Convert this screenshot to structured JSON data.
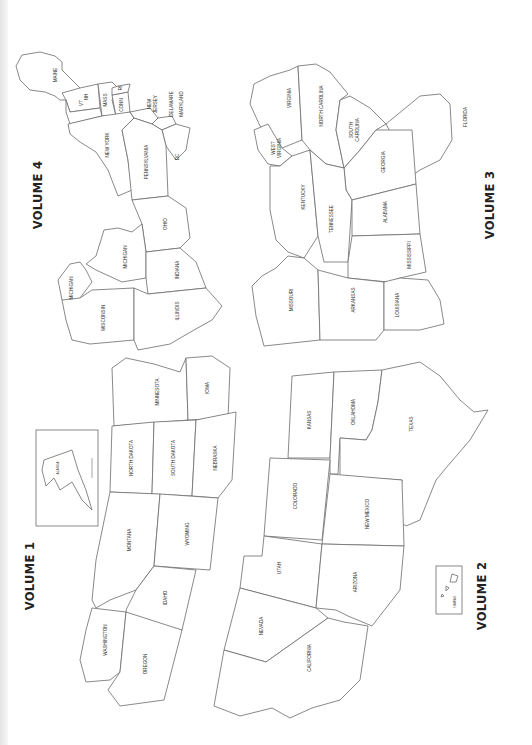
{
  "page": {
    "orientation": "rotated-90-counterclockwise",
    "background": "#ffffff",
    "line_color": "#6b6b6b",
    "text_color": "#222222"
  },
  "volumes": [
    {
      "title": "VOLUME 4",
      "states": [
        "MAINE",
        "VT",
        "NH",
        "MASS",
        "CONN",
        "RI",
        "NEW YORK",
        "NEW JERSEY",
        "DELAWARE",
        "MARYLAND",
        "PENNSYLVANIA",
        "DC",
        "OHIO",
        "MICHIGAN",
        "MICHIGAN",
        "INDIANA",
        "WISCONSIN",
        "ILLINOIS"
      ]
    },
    {
      "title": "VOLUME 3",
      "states": [
        "VIRGINIA",
        "WEST VIRGINIA",
        "NORTH CAROLINA",
        "SOUTH CAROLINA",
        "FLORIDA",
        "GEORGIA",
        "KENTUCKY",
        "TENNESSEE",
        "ALABAMA",
        "MISSISSIPPI",
        "MISSOURI",
        "ARKANSAS",
        "LOUISIANA"
      ]
    },
    {
      "title": "VOLUME 1",
      "states": [
        "MINNESOTA",
        "IOWA",
        "NORTH DAKOTA",
        "SOUTH DAKOTA",
        "NEBRASKA",
        "MONTANA",
        "WYOMING",
        "IDAHO",
        "WASHINGTON",
        "OREGON"
      ],
      "inset": "ALASKA"
    },
    {
      "title": "VOLUME 2",
      "states": [
        "KANSAS",
        "OKLAHOMA",
        "TEXAS",
        "COLORADO",
        "NEW MEXICO",
        "UTAH",
        "ARIZONA",
        "NEVADA",
        "CALIFORNIA"
      ],
      "inset": "HAWAII"
    }
  ],
  "labels": {
    "maine": "MAINE",
    "vt": "VT",
    "nh": "NH",
    "mass": "MASS",
    "conn": "CONN",
    "ri": "RI",
    "new_york": "NEW YORK",
    "new": "NEW",
    "jersey": "JERSEY",
    "delaware": "DELAWARE",
    "maryland": "MARYLAND",
    "pennsylvania": "PENNSYLVANIA",
    "dc": "DC",
    "ohio": "OHIO",
    "michigan_lower": "MICHIGAN",
    "michigan_upper": "MICHIGAN",
    "indiana": "INDIANA",
    "wisconsin": "WISCONSIN",
    "illinois": "ILLINOIS",
    "virginia": "VIRGINIA",
    "west": "WEST",
    "virginia2": "VIRGINIA",
    "north_carolina": "NORTH CAROLINA",
    "south": "SOUTH",
    "carolina": "CAROLINA",
    "florida": "FLORIDA",
    "georgia": "GEORGIA",
    "kentucky": "KENTUCKY",
    "tennessee": "TENNESSEE",
    "alabama": "ALABAMA",
    "mississippi": "MISSISSIPPI",
    "missouri": "MISSOURI",
    "arkansas": "ARKANSAS",
    "louisiana": "LOUISIANA",
    "minnesota": "MINNESOTA",
    "iowa": "IOWA",
    "north_dakota": "NORTH DAKOTA",
    "south_dakota": "SOUTH DAKOTA",
    "nebraska": "NEBRASKA",
    "montana": "MONTANA",
    "wyoming": "WYOMING",
    "idaho": "IDAHO",
    "washington": "WASHINGTON",
    "oregon": "OREGON",
    "alaska": "ALASKA",
    "kansas": "KANSAS",
    "oklahoma": "OKLAHOMA",
    "texas": "TEXAS",
    "colorado": "COLORADO",
    "new_mexico": "NEW MEXICO",
    "utah": "UTAH",
    "arizona": "ARIZONA",
    "nevada": "NEVADA",
    "california": "CALIFORNIA",
    "hawaii": "HAWAII",
    "vol1": "VOLUME 1",
    "vol2": "VOLUME 2",
    "vol3": "VOLUME 3",
    "vol4": "VOLUME 4"
  }
}
